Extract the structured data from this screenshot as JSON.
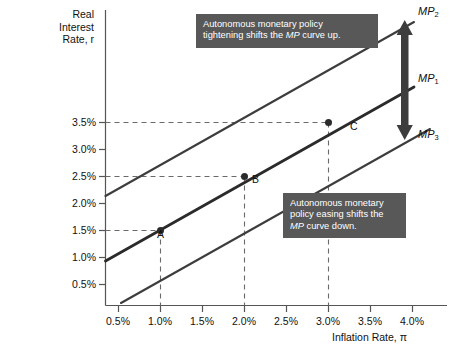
{
  "chart_data": {
    "type": "line",
    "title": "",
    "xlabel": "Inflation Rate, π",
    "ylabel": "Real Interest Rate, r",
    "ylabel_lines": [
      "Real",
      "Interest",
      "Rate, r"
    ],
    "xlim": [
      0.25,
      4.25
    ],
    "ylim": [
      0.0,
      4.6
    ],
    "grid": false,
    "xticks": [
      "0.5%",
      "1.0%",
      "1.5%",
      "2.0%",
      "2.5%",
      "3.0%",
      "3.5%",
      "4.0%"
    ],
    "xtick_values": [
      0.5,
      1.0,
      1.5,
      2.0,
      2.5,
      3.0,
      3.5,
      4.0
    ],
    "yticks": [
      "0.5%",
      "1.0%",
      "1.5%",
      "2.0%",
      "2.5%",
      "3.0%",
      "3.5%"
    ],
    "ytick_values": [
      0.5,
      1.0,
      1.5,
      2.0,
      2.5,
      3.0,
      3.5
    ],
    "series": [
      {
        "name": "MP2",
        "label": "MP",
        "subscript": "2",
        "role": "tightened-monetary-policy-curve",
        "color": "#3d3d3d",
        "x": [
          0.28,
          3.78
        ],
        "y": [
          2.05,
          5.25
        ],
        "comment": "upper parallel MP curve, shifted up"
      },
      {
        "name": "MP1",
        "label": "MP",
        "subscript": "1",
        "role": "initial-monetary-policy-curve",
        "color": "#3d3d3d",
        "x": [
          0.28,
          3.78
        ],
        "y": [
          1.03,
          4.22
        ],
        "comment": "original MP curve through points A, B and C"
      },
      {
        "name": "MP3",
        "label": "MP",
        "subscript": "3",
        "role": "eased-monetary-policy-curve",
        "color": "#3d3d3d",
        "x": [
          0.47,
          3.78
        ],
        "y": [
          0.06,
          3.08
        ],
        "comment": "lower parallel MP curve, shifted down"
      }
    ],
    "points": [
      {
        "label": "A",
        "x": 1.0,
        "y": 1.5,
        "x_text": "1.0%",
        "y_text": "1.5%",
        "series": "MP1"
      },
      {
        "label": "B",
        "x": 2.0,
        "y": 2.5,
        "x_text": "2.0%",
        "y_text": "2.5%",
        "series": "MP1"
      },
      {
        "label": "C",
        "x": 3.0,
        "y": 3.5,
        "x_text": "3.0%",
        "y_text": "3.5%",
        "series": "MP1"
      }
    ],
    "guidelines": [
      {
        "type": "horizontal",
        "value": 1.5,
        "from_point": "A",
        "style": "dashed"
      },
      {
        "type": "horizontal",
        "value": 2.5,
        "from_point": "B",
        "style": "dashed"
      },
      {
        "type": "horizontal",
        "value": 3.5,
        "from_point": "C",
        "style": "dashed"
      },
      {
        "type": "vertical",
        "value": 1.0,
        "from_point": "A",
        "style": "dashed"
      },
      {
        "type": "vertical",
        "value": 2.0,
        "from_point": "B",
        "style": "dashed"
      },
      {
        "type": "vertical",
        "value": 3.0,
        "from_point": "C",
        "style": "dashed"
      }
    ],
    "annotations": [
      {
        "id": "tightening",
        "text": "Autonomous monetary policy tightening shifts the MP curve up.",
        "lines": [
          "Autonomous monetary policy",
          "tightening shifts the MP curve up."
        ],
        "italic_word": "MP",
        "background": "#585858",
        "text_color": "#ffffff"
      },
      {
        "id": "easing",
        "text": "Autonomous monetary policy easing shifts the MP curve down.",
        "lines": [
          "Autonomous monetary",
          "policy easing shifts the",
          "MP curve down."
        ],
        "italic_word": "MP",
        "background": "#585858",
        "text_color": "#ffffff"
      }
    ],
    "arrow": {
      "id": "shift-arrow",
      "direction": "double-headed-vertical",
      "meaning": "MP curve shifts up or down",
      "color": "#3d3d3d"
    },
    "colors": {
      "axis": "#555555",
      "curve": "#3d3d3d",
      "highlight_curve": "#2b2b2b",
      "guideline": "#6a6a6a",
      "point": "#2b2b2b",
      "callout_bg": "#585858",
      "background": "#ffffff"
    }
  }
}
